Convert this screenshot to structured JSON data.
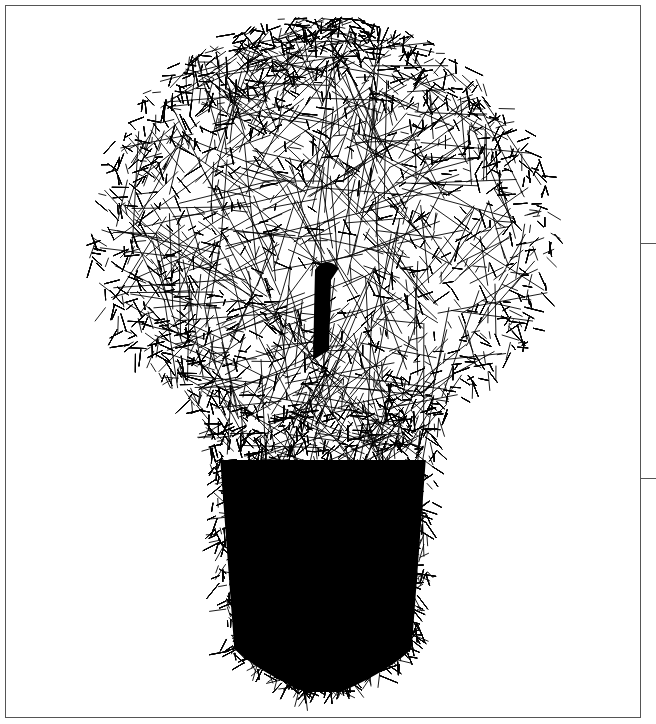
{
  "window": {
    "frame_color": "#555555",
    "background": "#ffffff"
  },
  "artwork": {
    "subject": "light-bulb",
    "style": "random line hatching",
    "stroke_color": "#000000",
    "center_x": 323,
    "bulb_top": 17,
    "globe_center_y": 240,
    "globe_radius_x": 232,
    "globe_radius_y": 225,
    "neck_y": 450,
    "base_bottom": 692,
    "base_width": 230,
    "tip_width": 100
  },
  "side_panel": {
    "dividers_y": [
      243,
      478
    ]
  },
  "status_bar": {
    "text": ""
  }
}
